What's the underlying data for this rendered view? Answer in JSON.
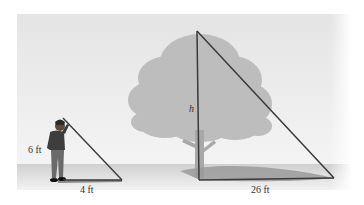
{
  "figure": {
    "labels": {
      "person_height": "6 ft",
      "person_shadow": "4 ft",
      "tree_height": "h",
      "tree_shadow": "26 ft"
    },
    "colors": {
      "sky_top": "#e6e6e6",
      "sky_bottom": "#f3f3f3",
      "ground": "#d5d5d5",
      "tree": "#bdbdbd",
      "shadow": "#9a9a9a",
      "triangle_line": "#3a3a3a"
    }
  }
}
